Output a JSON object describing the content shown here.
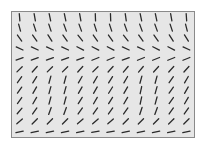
{
  "figure": {
    "type": "orientation-texture-field",
    "rows": 12,
    "cols": 12,
    "segment_length_px": 7.5,
    "colors": {
      "background": "#e6e6e6",
      "border": "#8a8a8a",
      "segment": "#2a2a2a",
      "page": "#ffffff"
    },
    "angle_units": "degrees from horizontal, positive rises to right",
    "angles": [
      [
        -85,
        -80,
        -78,
        -78,
        -80,
        -88,
        -88,
        -82,
        -78,
        -78,
        -80,
        -86
      ],
      [
        -75,
        -72,
        -72,
        -70,
        -70,
        -72,
        -72,
        -70,
        -70,
        -70,
        -72,
        -76
      ],
      [
        -55,
        -55,
        -58,
        -55,
        -52,
        -55,
        -55,
        -52,
        -55,
        -55,
        -58,
        -58
      ],
      [
        -25,
        -25,
        -25,
        -25,
        -28,
        -28,
        -28,
        -25,
        -25,
        -28,
        -28,
        -25
      ],
      [
        20,
        20,
        20,
        20,
        20,
        22,
        22,
        20,
        22,
        22,
        22,
        22
      ],
      [
        45,
        48,
        45,
        45,
        48,
        45,
        48,
        50,
        50,
        48,
        48,
        48
      ],
      [
        55,
        58,
        75,
        75,
        60,
        60,
        58,
        60,
        75,
        75,
        55,
        60
      ],
      [
        55,
        60,
        75,
        75,
        60,
        60,
        58,
        60,
        78,
        75,
        55,
        60
      ],
      [
        55,
        60,
        75,
        75,
        58,
        60,
        58,
        60,
        78,
        75,
        55,
        60
      ],
      [
        50,
        55,
        70,
        70,
        55,
        55,
        55,
        55,
        72,
        70,
        55,
        55
      ],
      [
        42,
        45,
        45,
        45,
        42,
        42,
        42,
        45,
        45,
        45,
        45,
        45
      ],
      [
        12,
        12,
        12,
        12,
        12,
        10,
        10,
        12,
        12,
        12,
        12,
        12
      ]
    ]
  }
}
